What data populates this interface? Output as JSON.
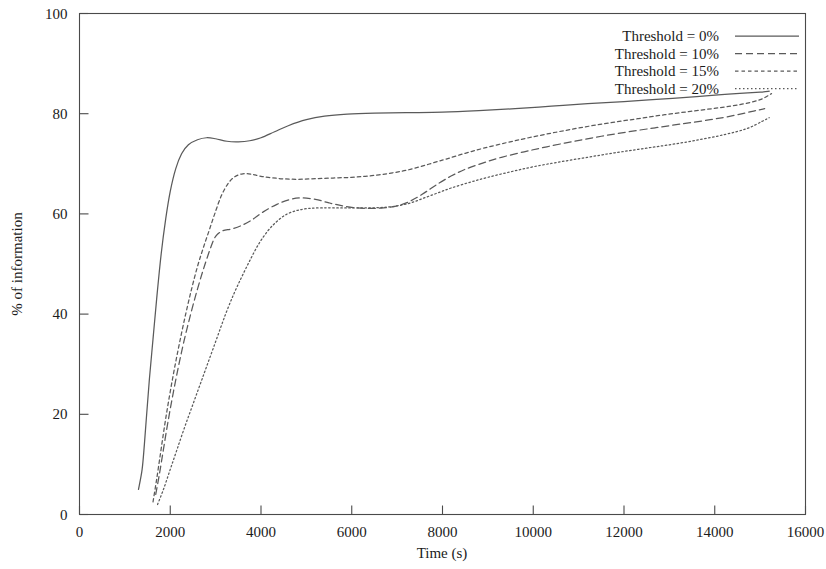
{
  "chart_data": {
    "type": "line",
    "title": "",
    "xlabel": "Time (s)",
    "ylabel": "% of information",
    "xlim": [
      0,
      16000
    ],
    "ylim": [
      0,
      100
    ],
    "xticks": [
      0,
      2000,
      4000,
      6000,
      8000,
      10000,
      12000,
      14000,
      16000
    ],
    "yticks": [
      0,
      20,
      40,
      60,
      80,
      100
    ],
    "xtick_labels": [
      "0",
      "2000",
      "4000",
      "6000",
      "8000",
      "10000",
      "12000",
      "14000",
      "16000"
    ],
    "ytick_labels": [
      "0",
      "20",
      "40",
      "60",
      "80",
      "100"
    ],
    "grid": false,
    "legend_position": "top-right",
    "series": [
      {
        "name": "Threshold = 0%",
        "style": "solid",
        "dasharray": "",
        "color": "#5a5a5a",
        "points": [
          [
            1300,
            5.0
          ],
          [
            1380,
            9.0
          ],
          [
            1430,
            14.0
          ],
          [
            1480,
            20.0
          ],
          [
            1540,
            27.0
          ],
          [
            1620,
            35.0
          ],
          [
            1700,
            43.0
          ],
          [
            1800,
            52.0
          ],
          [
            1900,
            59.0
          ],
          [
            2000,
            64.5
          ],
          [
            2120,
            69.0
          ],
          [
            2250,
            72.0
          ],
          [
            2400,
            73.8
          ],
          [
            2600,
            74.8
          ],
          [
            2800,
            75.2
          ],
          [
            3000,
            75.0
          ],
          [
            3250,
            74.5
          ],
          [
            3500,
            74.4
          ],
          [
            3750,
            74.6
          ],
          [
            4000,
            75.2
          ],
          [
            4300,
            76.4
          ],
          [
            4600,
            77.6
          ],
          [
            5000,
            78.8
          ],
          [
            5400,
            79.5
          ],
          [
            5900,
            79.9
          ],
          [
            6500,
            80.1
          ],
          [
            7200,
            80.2
          ],
          [
            8000,
            80.3
          ],
          [
            8800,
            80.6
          ],
          [
            9600,
            81.0
          ],
          [
            10400,
            81.5
          ],
          [
            11200,
            82.0
          ],
          [
            12000,
            82.4
          ],
          [
            12800,
            82.9
          ],
          [
            13600,
            83.4
          ],
          [
            14300,
            83.9
          ],
          [
            15000,
            84.3
          ],
          [
            15200,
            84.5
          ]
        ]
      },
      {
        "name": "Threshold = 10%",
        "style": "dashed",
        "dasharray": "7,4",
        "color": "#5a5a5a",
        "points": [
          [
            1680,
            4.0
          ],
          [
            1760,
            8.0
          ],
          [
            1850,
            13.0
          ],
          [
            1950,
            18.5
          ],
          [
            2060,
            24.0
          ],
          [
            2180,
            29.5
          ],
          [
            2300,
            34.5
          ],
          [
            2450,
            40.0
          ],
          [
            2600,
            45.0
          ],
          [
            2750,
            49.5
          ],
          [
            2900,
            53.5
          ],
          [
            3000,
            55.5
          ],
          [
            3150,
            56.6
          ],
          [
            3350,
            57.0
          ],
          [
            3550,
            57.6
          ],
          [
            3800,
            58.8
          ],
          [
            4050,
            60.4
          ],
          [
            4350,
            61.9
          ],
          [
            4650,
            62.9
          ],
          [
            4900,
            63.2
          ],
          [
            5200,
            62.9
          ],
          [
            5500,
            62.2
          ],
          [
            5800,
            61.6
          ],
          [
            6100,
            61.2
          ],
          [
            6400,
            61.1
          ],
          [
            6700,
            61.2
          ],
          [
            7000,
            61.6
          ],
          [
            7300,
            62.6
          ],
          [
            7600,
            64.2
          ],
          [
            7900,
            66.0
          ],
          [
            8200,
            67.6
          ],
          [
            8500,
            68.9
          ],
          [
            8900,
            70.2
          ],
          [
            9300,
            71.3
          ],
          [
            9800,
            72.4
          ],
          [
            10300,
            73.4
          ],
          [
            10900,
            74.5
          ],
          [
            11500,
            75.5
          ],
          [
            12100,
            76.4
          ],
          [
            12700,
            77.2
          ],
          [
            13300,
            78.0
          ],
          [
            13900,
            78.8
          ],
          [
            14400,
            79.6
          ],
          [
            14800,
            80.4
          ],
          [
            15100,
            81.0
          ]
        ]
      },
      {
        "name": "Threshold = 15%",
        "style": "dotted-dash",
        "dasharray": "3.5,3",
        "color": "#5a5a5a",
        "points": [
          [
            1620,
            2.5
          ],
          [
            1700,
            7.0
          ],
          [
            1790,
            12.5
          ],
          [
            1880,
            18.0
          ],
          [
            1980,
            23.5
          ],
          [
            2090,
            29.0
          ],
          [
            2210,
            34.5
          ],
          [
            2340,
            40.0
          ],
          [
            2470,
            45.0
          ],
          [
            2600,
            49.5
          ],
          [
            2720,
            53.0
          ],
          [
            2850,
            56.5
          ],
          [
            2980,
            60.0
          ],
          [
            3120,
            63.5
          ],
          [
            3270,
            66.0
          ],
          [
            3420,
            67.4
          ],
          [
            3600,
            68.0
          ],
          [
            3800,
            67.9
          ],
          [
            4000,
            67.5
          ],
          [
            4250,
            67.2
          ],
          [
            4500,
            67.0
          ],
          [
            4800,
            66.9
          ],
          [
            5100,
            67.0
          ],
          [
            5400,
            67.1
          ],
          [
            5700,
            67.2
          ],
          [
            6000,
            67.3
          ],
          [
            6300,
            67.5
          ],
          [
            6600,
            67.8
          ],
          [
            6900,
            68.2
          ],
          [
            7200,
            68.7
          ],
          [
            7500,
            69.4
          ],
          [
            7800,
            70.2
          ],
          [
            8100,
            71.0
          ],
          [
            8500,
            72.1
          ],
          [
            8900,
            73.1
          ],
          [
            9400,
            74.2
          ],
          [
            9900,
            75.2
          ],
          [
            10500,
            76.3
          ],
          [
            11100,
            77.3
          ],
          [
            11700,
            78.2
          ],
          [
            12300,
            79.0
          ],
          [
            12900,
            79.8
          ],
          [
            13500,
            80.5
          ],
          [
            14100,
            81.2
          ],
          [
            14600,
            81.9
          ],
          [
            15000,
            82.8
          ],
          [
            15250,
            84.0
          ]
        ]
      },
      {
        "name": "Threshold = 20%",
        "style": "dotted",
        "dasharray": "1.5,2.5",
        "color": "#5a5a5a",
        "points": [
          [
            1720,
            2.0
          ],
          [
            1850,
            5.0
          ],
          [
            2000,
            9.0
          ],
          [
            2150,
            13.0
          ],
          [
            2320,
            17.5
          ],
          [
            2500,
            22.0
          ],
          [
            2680,
            26.5
          ],
          [
            2860,
            31.0
          ],
          [
            3040,
            35.5
          ],
          [
            3220,
            40.0
          ],
          [
            3400,
            44.0
          ],
          [
            3580,
            47.5
          ],
          [
            3760,
            50.8
          ],
          [
            3950,
            54.0
          ],
          [
            4150,
            56.6
          ],
          [
            4350,
            58.5
          ],
          [
            4560,
            59.9
          ],
          [
            4800,
            60.7
          ],
          [
            5050,
            61.1
          ],
          [
            5350,
            61.2
          ],
          [
            5700,
            61.2
          ],
          [
            6050,
            61.2
          ],
          [
            6400,
            61.2
          ],
          [
            6700,
            61.3
          ],
          [
            7000,
            61.6
          ],
          [
            7300,
            62.2
          ],
          [
            7600,
            63.2
          ],
          [
            7900,
            64.2
          ],
          [
            8200,
            65.2
          ],
          [
            8600,
            66.3
          ],
          [
            9000,
            67.3
          ],
          [
            9500,
            68.4
          ],
          [
            10000,
            69.4
          ],
          [
            10600,
            70.4
          ],
          [
            11200,
            71.3
          ],
          [
            11800,
            72.2
          ],
          [
            12400,
            73.0
          ],
          [
            13000,
            73.8
          ],
          [
            13600,
            74.7
          ],
          [
            14200,
            75.8
          ],
          [
            14700,
            77.0
          ],
          [
            15050,
            78.5
          ],
          [
            15200,
            79.2
          ]
        ]
      }
    ]
  },
  "legend": {
    "entries": [
      {
        "label": "Threshold = 0%"
      },
      {
        "label": "Threshold = 10%"
      },
      {
        "label": "Threshold = 15%"
      },
      {
        "label": "Threshold = 20%"
      }
    ]
  }
}
